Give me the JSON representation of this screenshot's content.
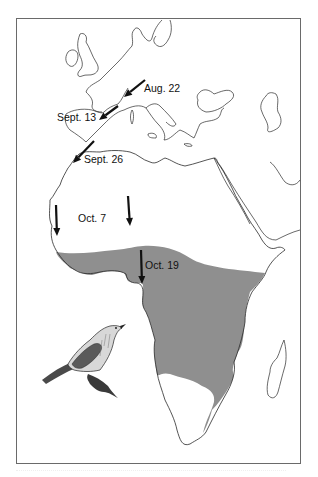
{
  "map": {
    "title": "Autumn migration of a warbler from Europe to Africa",
    "range_color": "#8f8f8f",
    "coast_color": "#2a2a2a",
    "arrow_color": "#111111",
    "waypoints": [
      {
        "id": "aug22",
        "label": "Aug. 22"
      },
      {
        "id": "sept13",
        "label": "Sept. 13"
      },
      {
        "id": "sept26",
        "label": "Sept. 26"
      },
      {
        "id": "oct7",
        "label": "Oct. 7"
      },
      {
        "id": "oct19",
        "label": "Oct. 19"
      }
    ],
    "legend": {
      "shaded_area": "Wintering range in Africa",
      "illustration": "Warbler perched on branch"
    }
  }
}
